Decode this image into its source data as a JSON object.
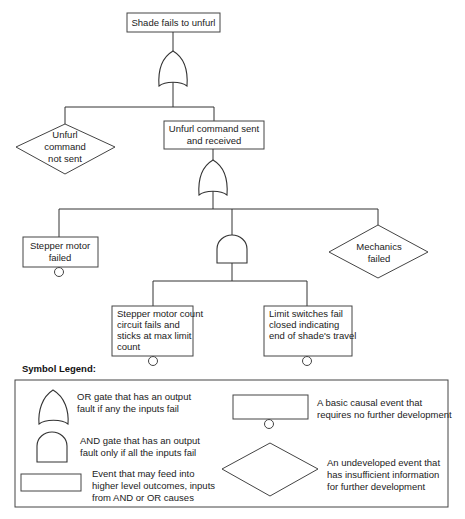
{
  "diagram": {
    "type": "fault-tree",
    "top_event": {
      "label": "Shade fails to unfurl"
    },
    "level1": {
      "gate": "OR",
      "children": [
        {
          "kind": "undeveloped",
          "lines": [
            "Unfurl",
            "command",
            "not sent"
          ]
        },
        {
          "kind": "event",
          "lines": [
            "Unfurl command sent",
            "and received"
          ]
        }
      ]
    },
    "level2": {
      "gate": "OR",
      "children": [
        {
          "kind": "basic",
          "lines": [
            "Stepper motor",
            "failed"
          ]
        },
        {
          "kind": "and-gate"
        },
        {
          "kind": "undeveloped",
          "lines": [
            "Mechanics",
            "failed"
          ]
        }
      ]
    },
    "level3": {
      "gate": "AND",
      "children": [
        {
          "kind": "basic",
          "lines": [
            "Stepper motor count",
            "circuit fails and",
            "sticks at max limit",
            "count"
          ]
        },
        {
          "kind": "basic",
          "lines": [
            "Limit switches fail",
            "closed indicating",
            "end of shade's travel"
          ]
        }
      ]
    }
  },
  "legend": {
    "title": "Symbol Legend:",
    "items": [
      {
        "symbol": "or-gate",
        "lines": [
          "OR gate that has an output",
          "fault if any the inputs fail"
        ]
      },
      {
        "symbol": "and-gate",
        "lines": [
          "AND gate that has an output",
          "fault only if all the inputs fail"
        ]
      },
      {
        "symbol": "event-rect",
        "lines": [
          "Event that may feed into",
          "higher level outcomes, inputs",
          "from AND or OR causes"
        ]
      },
      {
        "symbol": "basic-event",
        "lines": [
          "A basic causal event that",
          "requires no further development"
        ]
      },
      {
        "symbol": "undeveloped-diamond",
        "lines": [
          "An undeveloped event that",
          "has insufficient information",
          "for further development"
        ]
      }
    ]
  }
}
